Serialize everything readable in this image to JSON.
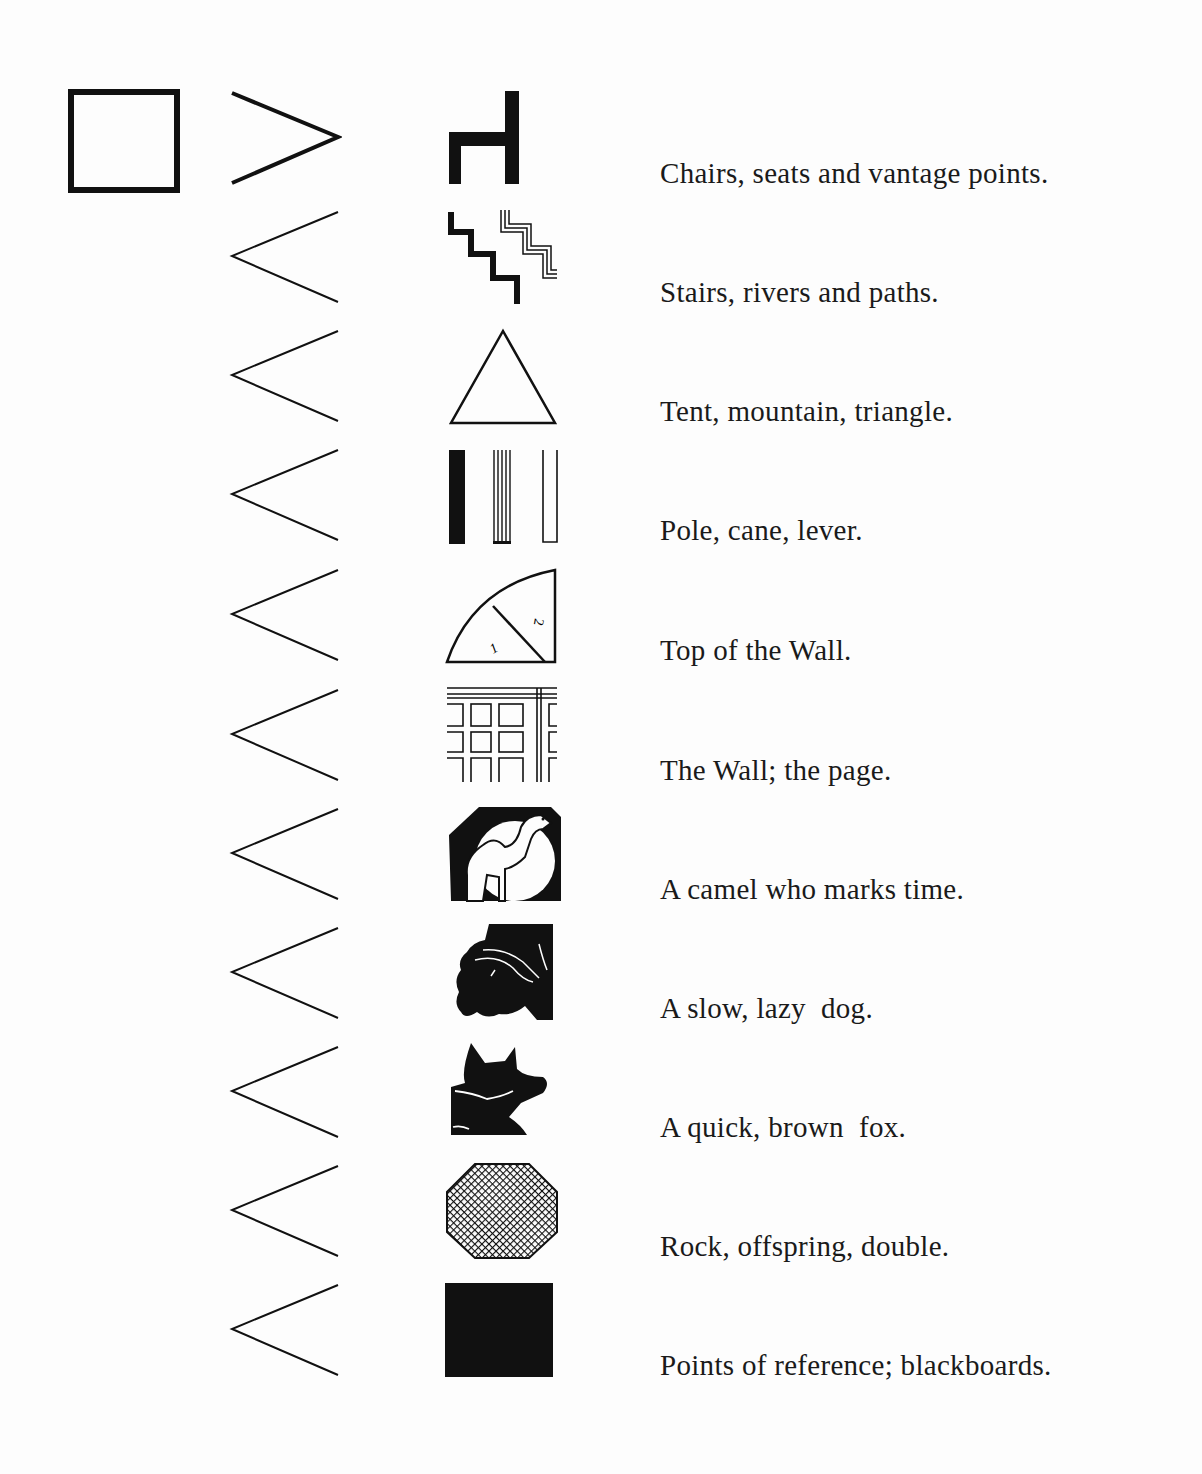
{
  "legend": {
    "header_symbol": "square-frame-icon",
    "items": [
      {
        "icon": "chair-icon",
        "chevron": "chevron-right-icon",
        "label": "Chairs, seats and vantage points."
      },
      {
        "icon": "stairs-icon",
        "chevron": "chevron-left-icon",
        "label": "Stairs, rivers and paths."
      },
      {
        "icon": "triangle-icon",
        "chevron": "chevron-left-icon",
        "label": "Tent, mountain, triangle."
      },
      {
        "icon": "poles-icon",
        "chevron": "chevron-left-icon",
        "label": "Pole, cane, lever."
      },
      {
        "icon": "quarter-circle-icon",
        "chevron": "chevron-left-icon",
        "label": "Top of the Wall.",
        "icon_numbers": [
          "1",
          "2"
        ]
      },
      {
        "icon": "wall-grid-icon",
        "chevron": "chevron-left-icon",
        "label": "The Wall; the page."
      },
      {
        "icon": "camel-icon",
        "chevron": "chevron-left-icon",
        "label": "A camel who marks time."
      },
      {
        "icon": "dog-icon",
        "chevron": "chevron-left-icon",
        "label": "A slow, lazy  dog."
      },
      {
        "icon": "fox-icon",
        "chevron": "chevron-left-icon",
        "label": "A quick, brown  fox."
      },
      {
        "icon": "crosshatch-octagon-icon",
        "chevron": "chevron-left-icon",
        "label": "Rock, offspring, double."
      },
      {
        "icon": "black-square-icon",
        "chevron": "chevron-left-icon",
        "label": "Points of reference; blackboards."
      }
    ]
  },
  "colors": {
    "ink": "#111111",
    "paper": "#fdfdfd"
  }
}
